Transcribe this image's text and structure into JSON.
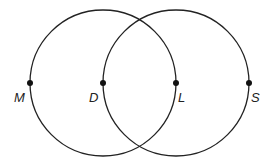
{
  "diagram": {
    "type": "two intersecting circles",
    "stroke_color": "#222222",
    "circles": [
      {
        "name": "left-circle",
        "cx": 103,
        "cy": 83,
        "r": 73
      },
      {
        "name": "right-circle",
        "cx": 176,
        "cy": 83,
        "r": 73
      }
    ],
    "points": [
      {
        "label": "M",
        "x": 30,
        "y": 83,
        "lx": 14,
        "ly": 101
      },
      {
        "label": "D",
        "x": 103,
        "y": 83,
        "lx": 88,
        "ly": 101
      },
      {
        "label": "L",
        "x": 176,
        "y": 83,
        "lx": 178,
        "ly": 101
      },
      {
        "label": "S",
        "x": 249,
        "y": 83,
        "lx": 251,
        "ly": 101
      }
    ]
  }
}
